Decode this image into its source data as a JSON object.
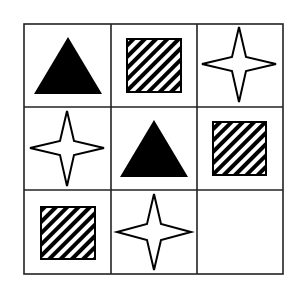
{
  "puzzle": {
    "type": "3x3 matrix",
    "colors": {
      "line": "#222222",
      "fill": "#000000",
      "background": "#ffffff"
    },
    "grid": {
      "x_lines": [
        24,
        111,
        197,
        283
      ],
      "y_lines": [
        24,
        107,
        190,
        274
      ]
    },
    "cells": [
      {
        "row": 0,
        "col": 0,
        "shape": "triangle",
        "fill": "solid-black"
      },
      {
        "row": 0,
        "col": 1,
        "shape": "square",
        "fill": "diagonal-stripes"
      },
      {
        "row": 0,
        "col": 2,
        "shape": "four-point-star",
        "fill": "white"
      },
      {
        "row": 1,
        "col": 0,
        "shape": "four-point-star",
        "fill": "white"
      },
      {
        "row": 1,
        "col": 1,
        "shape": "triangle",
        "fill": "solid-black"
      },
      {
        "row": 1,
        "col": 2,
        "shape": "square",
        "fill": "diagonal-stripes"
      },
      {
        "row": 2,
        "col": 0,
        "shape": "square",
        "fill": "diagonal-stripes"
      },
      {
        "row": 2,
        "col": 1,
        "shape": "four-point-star",
        "fill": "white"
      },
      {
        "row": 2,
        "col": 2,
        "shape": "empty",
        "fill": "none"
      }
    ]
  }
}
